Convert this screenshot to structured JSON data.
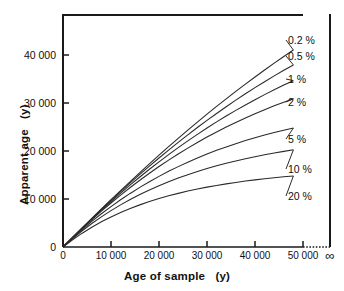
{
  "chart_data": {
    "type": "line",
    "title": "",
    "xlabel": "Age of sample   (y)",
    "ylabel": "Apparent age   (y)",
    "xlim": [
      0,
      50000
    ],
    "ylim": [
      0,
      48000
    ],
    "grid": false,
    "legend_position": "right-of-curve-ends",
    "x_ticks": [
      {
        "value": 0,
        "label": "0"
      },
      {
        "value": 10000,
        "label": "10 000"
      },
      {
        "value": 20000,
        "label": "20 000"
      },
      {
        "value": 30000,
        "label": "30 000"
      },
      {
        "value": 40000,
        "label": "40 000"
      },
      {
        "value": 50000,
        "label": "50 000"
      }
    ],
    "x_extra_tick": {
      "label": "∞",
      "note": "infinity at far right beyond dotted break"
    },
    "y_ticks": [
      {
        "value": 0,
        "label": "0"
      },
      {
        "value": 10000,
        "label": "10 000"
      },
      {
        "value": 20000,
        "label": "20 000"
      },
      {
        "value": 30000,
        "label": "30 000"
      },
      {
        "value": 40000,
        "label": "40 000"
      }
    ],
    "x": [
      0,
      2000,
      4000,
      6000,
      8000,
      10000,
      12000,
      14000,
      16000,
      18000,
      20000,
      22000,
      24000,
      26000,
      28000,
      30000,
      32000,
      34000,
      36000,
      38000,
      40000,
      42000,
      44000,
      46000,
      48000
    ],
    "series": [
      {
        "name": "0.2 %",
        "label": "0.2 %",
        "values": [
          0,
          1980,
          3950,
          5900,
          7830,
          9740,
          11620,
          13480,
          15320,
          17130,
          18910,
          20660,
          22380,
          24070,
          25730,
          27360,
          28960,
          30520,
          32060,
          33560,
          35030,
          36470,
          37870,
          39240,
          40580
        ]
      },
      {
        "name": "0.5 %",
        "label": "0.5 %",
        "values": [
          0,
          1970,
          3920,
          5840,
          7730,
          9590,
          11410,
          13200,
          14950,
          16660,
          18330,
          19960,
          21550,
          23100,
          24610,
          26080,
          27510,
          28900,
          30250,
          31560,
          32830,
          34060,
          35250,
          36400,
          37510
        ]
      },
      {
        "name": "1 %",
        "label": "1 %",
        "values": [
          0,
          1960,
          3880,
          5760,
          7590,
          9370,
          11100,
          12790,
          14420,
          16010,
          17540,
          19030,
          20470,
          21860,
          23210,
          24510,
          25770,
          26980,
          28150,
          29270,
          30350,
          31390,
          32390,
          33350,
          34270
        ]
      },
      {
        "name": "2 %",
        "label": "2 %",
        "values": [
          0,
          1930,
          3810,
          5620,
          7380,
          9060,
          10690,
          12250,
          13750,
          15190,
          16570,
          17890,
          19160,
          20370,
          21530,
          22640,
          23700,
          24710,
          25670,
          26590,
          27460,
          28290,
          29080,
          29830,
          30540
        ]
      },
      {
        "name": "5 %",
        "label": "5 %",
        "values": [
          0,
          1850,
          3610,
          5270,
          6840,
          8320,
          9720,
          11040,
          12280,
          13450,
          14550,
          15590,
          16560,
          17480,
          18340,
          19150,
          19910,
          20620,
          21290,
          21920,
          22510,
          23060,
          23580,
          24060,
          24520
        ]
      },
      {
        "name": "10 %",
        "label": "10 %",
        "values": [
          0,
          1730,
          3340,
          4830,
          6210,
          7490,
          8680,
          9780,
          10800,
          11750,
          12630,
          13440,
          14200,
          14900,
          15550,
          16160,
          16720,
          17240,
          17730,
          18180,
          18600,
          18990,
          19360,
          19700,
          20020
        ]
      },
      {
        "name": "20 %",
        "label": "20 %",
        "values": [
          0,
          1500,
          2850,
          4080,
          5190,
          6190,
          7100,
          7930,
          8680,
          9360,
          9980,
          10540,
          11050,
          11520,
          11940,
          12330,
          12680,
          13010,
          13300,
          13580,
          13830,
          14060,
          14270,
          14460,
          14640
        ]
      }
    ]
  },
  "axes": {
    "frame_color": "#1a1a1a",
    "curve_color": "#2a2a2a"
  }
}
